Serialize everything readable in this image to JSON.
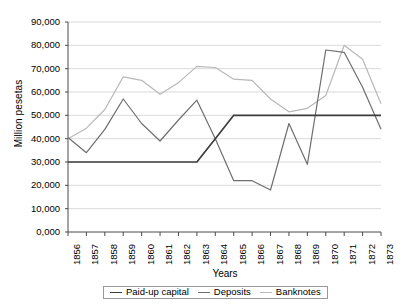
{
  "chart_data": {
    "type": "line",
    "title": "",
    "xlabel": "Years",
    "ylabel": "Million pesetas",
    "ylim": [
      0,
      90000
    ],
    "grid": true,
    "legend_position": "bottom",
    "categories": [
      "1856",
      "1857",
      "1858",
      "1859",
      "1860",
      "1861",
      "1862",
      "1863",
      "1864",
      "1865",
      "1866",
      "1867",
      "1868",
      "1869",
      "1870",
      "1871",
      "1872",
      "1873"
    ],
    "yticks": [
      "0,000",
      "10,000",
      "20,000",
      "30,000",
      "40,000",
      "50,000",
      "60,000",
      "70,000",
      "80,000",
      "90,000"
    ],
    "ytick_values": [
      0,
      10000,
      20000,
      30000,
      40000,
      50000,
      60000,
      70000,
      80000,
      90000
    ],
    "series": [
      {
        "name": "Paid-up capital",
        "color": "#3c3c3c",
        "values": [
          30000,
          30000,
          30000,
          30000,
          30000,
          30000,
          30000,
          30000,
          40000,
          50000,
          50000,
          50000,
          50000,
          50000,
          50000,
          50000,
          50000,
          50000
        ]
      },
      {
        "name": "Deposits",
        "color": "#6e6e6e",
        "values": [
          40500,
          34000,
          44000,
          57000,
          46500,
          39000,
          48000,
          56500,
          40000,
          22000,
          22000,
          18000,
          46500,
          29000,
          78000,
          77000,
          62000,
          44000
        ]
      },
      {
        "name": "Banknotes",
        "color": "#b8b8b8",
        "values": [
          40000,
          44500,
          52500,
          66500,
          65000,
          59000,
          64000,
          71000,
          70500,
          65500,
          65000,
          57000,
          51500,
          53000,
          58500,
          80000,
          74000,
          55000
        ]
      }
    ]
  },
  "legend": {
    "items": [
      {
        "label": "Paid-up capital"
      },
      {
        "label": "Deposits"
      },
      {
        "label": "Banknotes"
      }
    ]
  }
}
